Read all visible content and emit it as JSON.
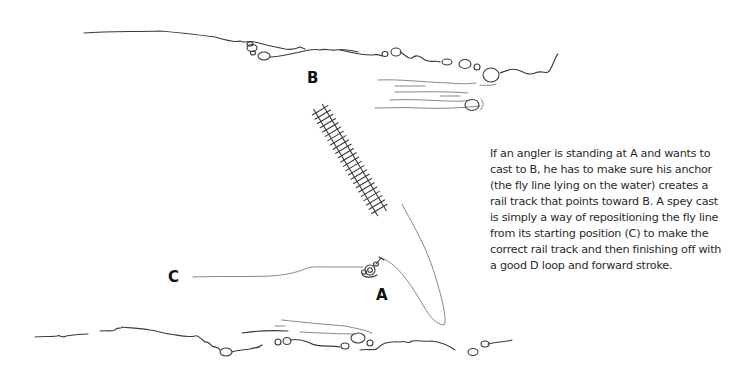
{
  "diagram": {
    "labels": {
      "a": "A",
      "b": "B",
      "c": "C"
    },
    "elements": {
      "far_bank": "river bank (top)",
      "near_bank": "river bank (bottom)",
      "rail_track": "rail track pointing toward B",
      "fly_line_start": "fly line lying at starting position C",
      "fly_line_anchor": "fly line forming anchor / D loop from A",
      "angler": "angler standing at A"
    },
    "caption": "If an angler is standing at A and wants to cast to B, he has to make sure his anchor (the fly line lying on the water) creates a rail track that points toward B. A spey cast is simply a way of repositioning the fly line from its starting position (C) to make the correct rail track and then finishing off with a good D loop and forward stroke.",
    "colors": {
      "ink": "#3a3a3a",
      "text": "#2a2a2a",
      "background": "#ffffff"
    }
  }
}
